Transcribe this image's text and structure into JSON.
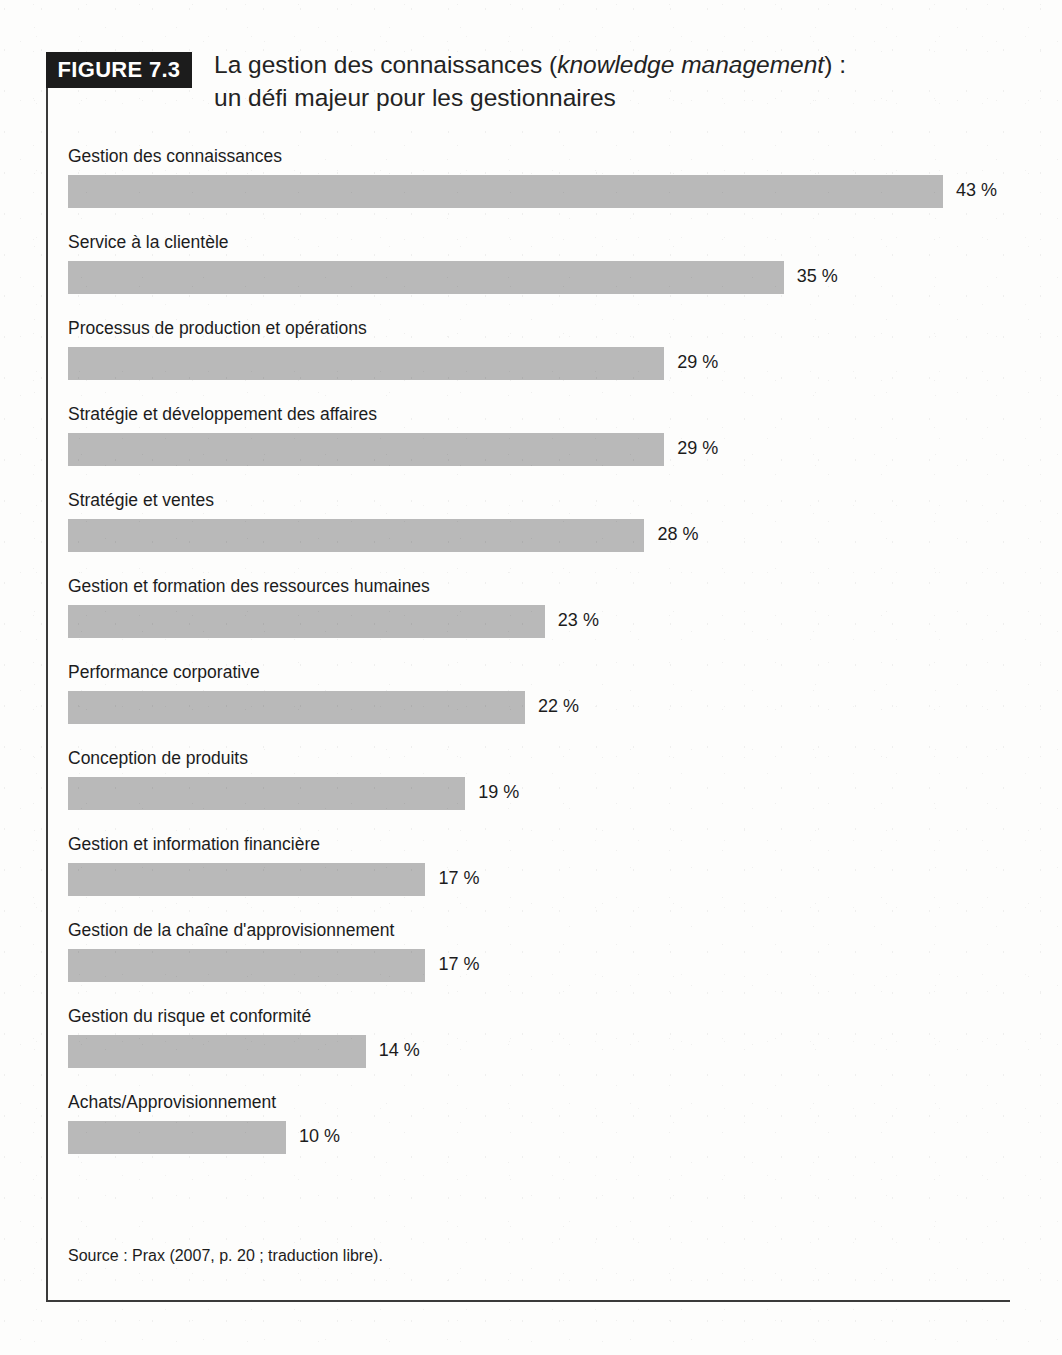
{
  "figure": {
    "badge_label": "FIGURE 7.3",
    "title_line1_part1": "La gestion des connaissances (",
    "title_line1_em": "knowledge management",
    "title_line1_part2": ") :",
    "title_line2": "un défi majeur pour les gestionnaires",
    "source": "Source : Prax (2007, p. 20 ; traduction libre)."
  },
  "colors": {
    "bar_fill": "#b9b9b9",
    "badge_bg": "#1c1c1c",
    "badge_text": "#ffffff",
    "frame_border": "#3a3a3a",
    "text": "#1c1c1c"
  },
  "chart_data": {
    "type": "bar",
    "orientation": "horizontal",
    "title": "La gestion des connaissances (knowledge management) : un défi majeur pour les gestionnaires",
    "xlabel": "",
    "ylabel": "",
    "xlim": [
      0,
      43
    ],
    "grid": false,
    "legend": "none",
    "value_suffix": "%",
    "categories": [
      "Gestion des connaissances",
      "Service à la clientèle",
      "Processus de production et opérations",
      "Stratégie et développement des affaires",
      "Stratégie et ventes",
      "Gestion et formation des ressources humaines",
      "Performance corporative",
      "Conception de produits",
      "Gestion et information financière",
      "Gestion de la chaîne d'approvisionnement",
      "Gestion du risque et conformité",
      "Achats/Approvisionnement"
    ],
    "values": [
      43,
      35,
      29,
      29,
      28,
      23,
      22,
      19,
      17,
      17,
      14,
      10
    ],
    "value_labels": [
      "43 %",
      "35 %",
      "29 %",
      "29 %",
      "28 %",
      "23 %",
      "22 %",
      "19 %",
      "17 %",
      "17 %",
      "14 %",
      "10 %"
    ],
    "source": "Source : Prax (2007, p. 20 ; traduction libre)."
  }
}
